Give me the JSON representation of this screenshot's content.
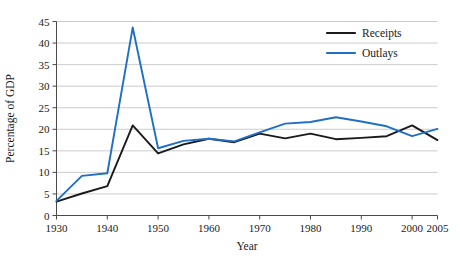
{
  "chart_data": {
    "type": "line",
    "title": "",
    "xlabel": "Year",
    "ylabel": "Percentage of GDP",
    "xlim": [
      1930,
      2005
    ],
    "ylim": [
      0,
      45
    ],
    "grid": true,
    "legend_position": "top-right",
    "xticks": [
      1930,
      1940,
      1950,
      1960,
      1970,
      1980,
      1990,
      2000,
      2005
    ],
    "xtick_labels": [
      "1930",
      "1940",
      "1950",
      "1960",
      "1970",
      "1980",
      "1990",
      "2000",
      "2005"
    ],
    "yticks": [
      0,
      5,
      10,
      15,
      20,
      25,
      30,
      35,
      40,
      45
    ],
    "ytick_labels": [
      "0",
      "5",
      "10",
      "15",
      "20",
      "25",
      "30",
      "35",
      "40",
      "45"
    ],
    "series": [
      {
        "name": "Receipts",
        "color": "#1a1a1a",
        "x": [
          1930,
          1935,
          1940,
          1945,
          1950,
          1955,
          1960,
          1965,
          1970,
          1975,
          1980,
          1985,
          1990,
          1995,
          2000,
          2005
        ],
        "values": [
          3.2,
          5.1,
          6.8,
          20.9,
          14.4,
          16.5,
          17.8,
          17.0,
          19.0,
          17.9,
          19.0,
          17.7,
          18.0,
          18.4,
          20.9,
          17.5
        ]
      },
      {
        "name": "Outlays",
        "color": "#1f6fc4",
        "x": [
          1930,
          1935,
          1940,
          1945,
          1950,
          1955,
          1960,
          1965,
          1970,
          1975,
          1980,
          1985,
          1990,
          1995,
          2000,
          2005
        ],
        "values": [
          3.4,
          9.2,
          9.8,
          43.6,
          15.6,
          17.3,
          17.8,
          17.2,
          19.3,
          21.3,
          21.7,
          22.8,
          21.8,
          20.7,
          18.4,
          20.1
        ]
      }
    ]
  },
  "legend": {
    "entries": [
      {
        "label": "Receipts",
        "color": "#1a1a1a"
      },
      {
        "label": "Outlays",
        "color": "#1f6fc4"
      }
    ]
  },
  "axes": {
    "x_title": "Year",
    "y_title": "Percentage of GDP"
  }
}
